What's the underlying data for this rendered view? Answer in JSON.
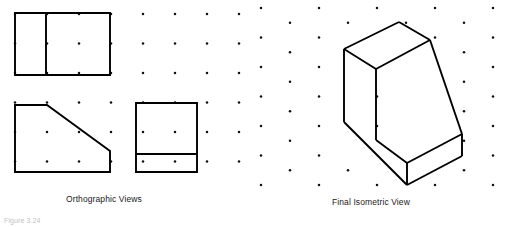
{
  "figure": {
    "caption": "Figure 3.24",
    "background_color": "#ffffff",
    "line_color": "#000000",
    "dot_color": "#111111"
  },
  "labels": {
    "orthographic": "Orthographic Views",
    "isometric": "Final Isometric View"
  },
  "orthographic_panel": {
    "grid": {
      "type": "square",
      "spacing_x": 32,
      "spacing_y": 29.5,
      "origin_x": 15,
      "origin_y": 14,
      "columns": 8,
      "rows": 7
    },
    "views": [
      {
        "name": "top-view",
        "shape": "rectangle-with-vertical-divider",
        "outline": "15,13 110,13 110,75 15,75",
        "divider": "46,13 46,75"
      },
      {
        "name": "front-view",
        "shape": "chamfered-trapezoid",
        "outline": "15,105 47,105 110,151 110,172 15,172"
      },
      {
        "name": "side-view",
        "shape": "rectangle-with-horizontal-divider",
        "outline": "136,103 197,103 197,172 136,172",
        "divider": "136,154 197,154"
      }
    ]
  },
  "isometric_panel": {
    "grid": {
      "type": "isometric-staggered",
      "spacing_x": 29,
      "spacing_y": 29.5,
      "origin_x": 261,
      "origin_y": 8,
      "columns": 9,
      "rows": 8
    },
    "solid": {
      "name": "inclined-wedge-block",
      "faces": [
        {
          "name": "top-face",
          "points": "344,49 399,22 430,40 376,69"
        },
        {
          "name": "left-face",
          "points": "344,49 376,69 376,140 344,122"
        },
        {
          "name": "slant-face",
          "points": "376,69 430,40 462,134 407,163"
        },
        {
          "name": "front-lower-face",
          "points": "344,122 376,140 407,163 407,185 344,147"
        },
        {
          "name": "right-face",
          "points": "430,40 462,134 462,156 430,140"
        },
        {
          "name": "base-right-face",
          "points": "407,163 462,134 462,156 407,185"
        }
      ],
      "edges": [
        "344,49 399,22",
        "399,22 430,40",
        "430,40 376,69",
        "376,69 344,49",
        "344,49 344,122",
        "376,69 376,140",
        "344,122 407,185",
        "430,40 462,134",
        "376,140 407,163",
        "407,163 462,134",
        "407,163 407,185",
        "462,134 462,156",
        "407,185 462,156"
      ]
    }
  }
}
